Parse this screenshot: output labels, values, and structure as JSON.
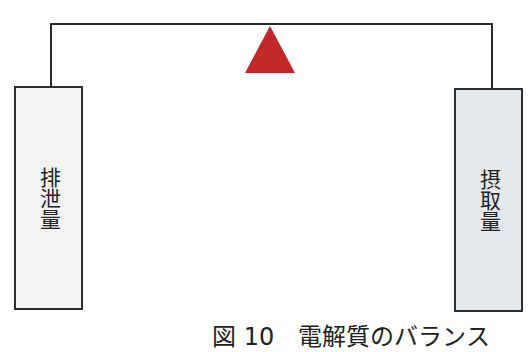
{
  "diagram": {
    "title_caption": "図 10　電解質のバランス",
    "fulcrum": {
      "shape": "triangle",
      "color": "#c0282a"
    },
    "beam_color": "#2a2a2a",
    "left_box": {
      "label": "排泄量",
      "fill": "#f4f2f2"
    },
    "right_box": {
      "label": "摂取量",
      "fill": "#e6e9ec"
    }
  }
}
